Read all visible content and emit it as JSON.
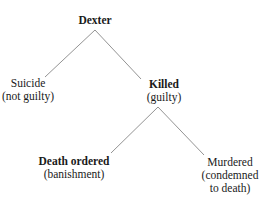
{
  "diagram": {
    "type": "tree",
    "nodes": [
      {
        "id": "root",
        "lines": [
          "Dexter"
        ],
        "bold": true
      },
      {
        "id": "suicide",
        "lines": [
          "Suicide",
          "(not guilty)"
        ],
        "bold": false
      },
      {
        "id": "killed",
        "lines": [
          "Killed",
          "(guilty)"
        ],
        "bold": true
      },
      {
        "id": "death",
        "lines": [
          "Death ordered",
          "(banishment)"
        ],
        "bold": true
      },
      {
        "id": "murdered",
        "lines": [
          "Murdered",
          "(condemned",
          "to death)"
        ],
        "bold": false
      }
    ],
    "edges": [
      {
        "from": "root",
        "to": "suicide"
      },
      {
        "from": "root",
        "to": "killed"
      },
      {
        "from": "killed",
        "to": "death"
      },
      {
        "from": "killed",
        "to": "murdered"
      }
    ]
  }
}
